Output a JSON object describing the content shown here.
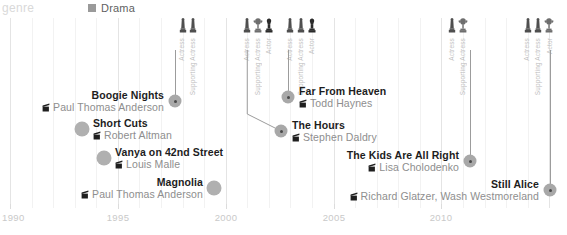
{
  "header": {
    "genre_label": "genre",
    "legend": [
      {
        "label": "Drama",
        "color": "#9a9a9a",
        "swatch_name": "drama-swatch"
      }
    ]
  },
  "axis": {
    "ticks": [
      "1990",
      "1995",
      "2000",
      "2005",
      "2010"
    ],
    "tick_years": [
      1990,
      1995,
      2000,
      2005,
      2010
    ],
    "range": [
      1990,
      2015.5
    ]
  },
  "award_columns": [
    {
      "label": "Actress",
      "icon": "oscar-statuette-icon",
      "year": 1998
    },
    {
      "label": "Supporting Actress",
      "icon": "oscar-statuette-icon",
      "year": 1998.5
    },
    {
      "label": "Actress",
      "icon": "oscar-statuette-icon",
      "year": 2001
    },
    {
      "label": "Supporting Actress",
      "icon": "oscar-trophy-icon",
      "year": 2001.5
    },
    {
      "label": "Actor",
      "icon": "oscar-dark-icon",
      "year": 2002
    },
    {
      "label": "Actress",
      "icon": "oscar-statuette-icon",
      "year": 2003
    },
    {
      "label": "Supporting Actress",
      "icon": "oscar-statuette-icon",
      "year": 2003.5
    },
    {
      "label": "Actor",
      "icon": "oscar-dark-icon",
      "year": 2004
    },
    {
      "label": "Actress",
      "icon": "oscar-statuette-icon",
      "year": 2010.5
    },
    {
      "label": "Supporting Actress",
      "icon": "oscar-trophy-icon",
      "year": 2011
    },
    {
      "label": "Actress",
      "icon": "oscar-statuette-icon",
      "year": 2014
    },
    {
      "label": "Supporting Actress",
      "icon": "oscar-statuette-icon",
      "year": 2014.5
    },
    {
      "label": "Actor",
      "icon": "oscar-trophy-icon",
      "year": 2015
    }
  ],
  "chart_data": {
    "type": "scatter",
    "title": "",
    "xlabel": "",
    "ylabel": "",
    "xlim": [
      1990,
      2015.5
    ],
    "grid": true,
    "legend_position": "top-left",
    "categories": [
      "Drama"
    ],
    "films": [
      {
        "title": "Boogie Nights",
        "director": "Paul Thomas Anderson",
        "year": 1997,
        "label_side": "left",
        "award": true
      },
      {
        "title": "Short Cuts",
        "director": "Robert Altman",
        "year": 1993,
        "label_side": "right",
        "award": false
      },
      {
        "title": "Vanya on 42nd Street",
        "director": "Louis Malle",
        "year": 1994,
        "label_side": "right",
        "award": false
      },
      {
        "title": "Magnolia",
        "director": "Paul Thomas Anderson",
        "year": 1999,
        "label_side": "left",
        "award": false
      },
      {
        "title": "Far From Heaven",
        "director": "Todd Haynes",
        "year": 2002,
        "label_side": "right",
        "award": true
      },
      {
        "title": "The Hours",
        "director": "Stephen Daldry",
        "year": 2002,
        "label_side": "right",
        "award": true
      },
      {
        "title": "The Kids Are All Right",
        "director": "Lisa Cholodenko",
        "year": 2010,
        "label_side": "left",
        "award": true
      },
      {
        "title": "Still Alice",
        "director": "Richard Glatzer, Wash Westmoreland",
        "year": 2014,
        "label_side": "left",
        "award": true
      }
    ]
  }
}
